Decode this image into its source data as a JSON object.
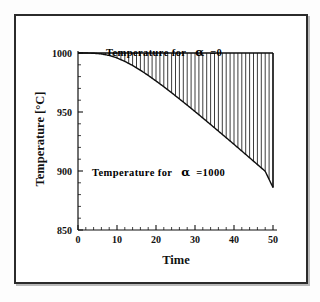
{
  "figure": {
    "frame_color": "#2b2b2b",
    "background_color": "#ffffff",
    "ink_color": "#111111"
  },
  "chart_data": {
    "type": "line",
    "title": "",
    "xlabel": "Time",
    "ylabel": "Temperature  [°C]",
    "xlim": [
      0,
      50
    ],
    "ylim": [
      850,
      1000
    ],
    "xticks": [
      0,
      10,
      20,
      30,
      40,
      50
    ],
    "xtick_labels": [
      "0",
      "10",
      "20",
      "30",
      "40",
      "50"
    ],
    "yticks": [
      850,
      900,
      950,
      1000
    ],
    "ytick_labels": [
      "850",
      "900",
      "950",
      "1000"
    ],
    "x_minor_per_major": 5,
    "y_minor_per_major": 5,
    "grid": false,
    "legend_position": "in-plot-annotations",
    "fill_between": {
      "style": "vertical-hatch",
      "line_count": 50,
      "color": "#1a1a1a"
    },
    "series": [
      {
        "name": "Temperature for α =0",
        "label": "Temperature for",
        "alpha_symbol": "α",
        "alpha_value": "=0",
        "color": "#0d0d0d",
        "x": [
          0,
          5,
          10,
          15,
          20,
          25,
          30,
          35,
          40,
          45,
          50
        ],
        "values": [
          1000,
          1000,
          1000,
          1000,
          1000,
          1000,
          1000,
          1000,
          1000,
          1000,
          1000
        ]
      },
      {
        "name": "Temperature for α =1000",
        "label": "Temperature for",
        "alpha_symbol": "α",
        "alpha_value": "=1000",
        "color": "#0d0d0d",
        "x": [
          0,
          2,
          4,
          6,
          8,
          10,
          12,
          14,
          16,
          18,
          20,
          22,
          24,
          26,
          28,
          30,
          32,
          34,
          36,
          38,
          40,
          42,
          44,
          46,
          48,
          50
        ],
        "values": [
          1000.0,
          1000.0,
          999.8,
          999.2,
          997.9,
          995.8,
          992.9,
          989.4,
          985.4,
          981.0,
          976.3,
          971.4,
          966.3,
          961.1,
          955.8,
          950.4,
          944.9,
          939.4,
          933.8,
          928.2,
          922.6,
          916.9,
          911.2,
          905.5,
          899.8,
          886.0
        ]
      }
    ],
    "annotations": [
      {
        "id": "upper-curve-annotation",
        "text": "Temperature for",
        "symbol": "α",
        "suffix": "=0",
        "x_data": 23,
        "y_data": 1004
      },
      {
        "id": "lower-curve-annotation",
        "text": "Temperature for",
        "symbol": "α",
        "suffix": "=1000",
        "x_data": 10,
        "y_data": 903
      }
    ]
  }
}
